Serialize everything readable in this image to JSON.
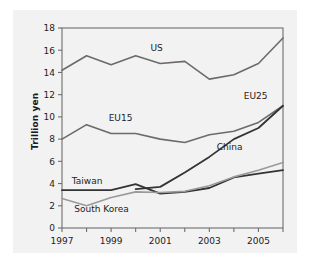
{
  "figure": {
    "background_color": "#ffffff",
    "panel_color": "#f2f2f2",
    "frame_color": "#6e6e6e"
  },
  "axis": {
    "ylabel": "Trillion yen",
    "xlabel": "",
    "y_ticks": [
      "0",
      "2",
      "4",
      "6",
      "8",
      "10",
      "12",
      "14",
      "16",
      "18"
    ],
    "x_ticks": [
      "1997",
      "",
      "1999",
      "",
      "2001",
      "",
      "2003",
      "",
      "2005",
      ""
    ],
    "x_tick_labels_shown": [
      "1997",
      "1999",
      "2001",
      "2003",
      "2005"
    ]
  },
  "chart_data": {
    "type": "line",
    "title": "",
    "subtitle": "",
    "xlabel": "",
    "ylabel": "Trillion yen",
    "xlim": [
      1997,
      2006
    ],
    "ylim": [
      0,
      18
    ],
    "ytick_step": 2,
    "grid": false,
    "legend": "inline-labels",
    "x": [
      1997,
      1998,
      1999,
      2000,
      2001,
      2002,
      2003,
      2004,
      2005,
      2006
    ],
    "series": [
      {
        "name": "US",
        "color": "#6b6b6b",
        "width": 1.6,
        "label_x": 2000.6,
        "label_y": 15.9,
        "values": [
          14.2,
          15.5,
          14.7,
          15.5,
          14.8,
          15.0,
          13.4,
          13.8,
          14.8,
          17.1
        ]
      },
      {
        "name": "EU25",
        "color": "#6b6b6b",
        "width": 1.6,
        "label_x": 2004.4,
        "label_y": 11.6,
        "values": [
          8.0,
          9.3,
          8.5,
          8.5,
          8.0,
          7.7,
          8.4,
          8.7,
          9.5,
          11.0
        ]
      },
      {
        "name": "EU15",
        "color": "#6b6b6b",
        "width": 1.6,
        "label_x": 1998.9,
        "label_y": 9.6,
        "values": [
          8.0,
          9.3,
          8.5,
          8.5,
          8.0,
          7.7,
          8.4,
          8.7,
          9.5,
          11.0
        ],
        "is_label_only": true
      },
      {
        "name": "China",
        "color": "#333333",
        "width": 1.8,
        "label_x": 2003.3,
        "label_y": 7.0,
        "values": [
          null,
          null,
          null,
          3.5,
          3.7,
          5.0,
          6.4,
          8.0,
          9.0,
          11.0
        ]
      },
      {
        "name": "Taiwan",
        "color": "#333333",
        "width": 1.8,
        "label_x": 1997.4,
        "label_y": 4.0,
        "values": [
          3.4,
          3.4,
          3.4,
          3.95,
          3.1,
          3.25,
          3.6,
          4.55,
          4.9,
          5.2
        ]
      },
      {
        "name": "South Korea",
        "color": "#9a9a9a",
        "width": 1.6,
        "label_x": 1997.5,
        "label_y": 1.45,
        "values": [
          2.65,
          2.0,
          2.75,
          3.25,
          3.2,
          3.3,
          3.8,
          4.6,
          5.2,
          5.9
        ]
      }
    ]
  }
}
